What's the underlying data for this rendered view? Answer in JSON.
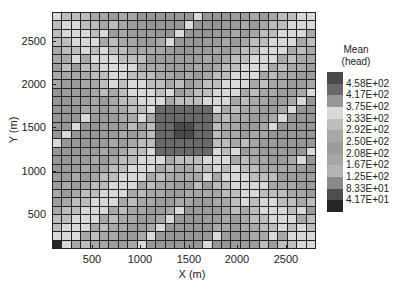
{
  "chart_data": {
    "type": "heatmap",
    "title": "",
    "xlabel": "X (m)",
    "ylabel": "Y (m)",
    "xticks": [
      500,
      1000,
      1500,
      2000,
      2500
    ],
    "yticks": [
      500,
      1000,
      1500,
      2000,
      2500
    ],
    "xlim": [
      100,
      2800
    ],
    "ylim": [
      100,
      2800
    ],
    "grid_size": [
      28,
      28
    ],
    "colorbar": {
      "title_line1": "Mean",
      "title_line2": "(head)",
      "labels": [
        "4.58E+02",
        "4.17E+02",
        "3.75E+02",
        "3.33E+02",
        "2.92E+02",
        "2.50E+02",
        "2.08E+02",
        "1.67E+02",
        "1.25E+02",
        "8.33E+01",
        "4.17E+01"
      ],
      "colors": [
        "#4a4a4a",
        "#6a6a6a",
        "#969696",
        "#d9d9d9",
        "#bdbdbd",
        "#a8a8a8",
        "#9c9c9c",
        "#a6a6a6",
        "#b4b4b4",
        "#8a8a8a",
        "#4e4e4e",
        "#262626"
      ]
    }
  },
  "axes": {
    "x_label": "X (m)",
    "y_label": "Y (m)",
    "x_ticks": [
      {
        "label": "500",
        "px": 92
      },
      {
        "label": "1000",
        "px": 140
      },
      {
        "label": "1500",
        "px": 189
      },
      {
        "label": "2000",
        "px": 237
      },
      {
        "label": "2500",
        "px": 286
      }
    ],
    "y_ticks": [
      {
        "label": "2500",
        "px": 41
      },
      {
        "label": "2000",
        "px": 84
      },
      {
        "label": "1500",
        "px": 127
      },
      {
        "label": "1000",
        "px": 171
      },
      {
        "label": "500",
        "px": 214
      }
    ]
  },
  "legend": {
    "title_line1": "Mean",
    "title_line2": "(head)"
  }
}
